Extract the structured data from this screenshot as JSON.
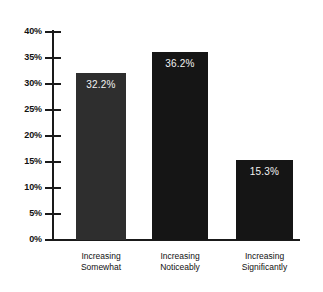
{
  "chart_data": {
    "type": "bar",
    "title": "",
    "subtitle": "",
    "xlabel": "",
    "ylabel": "",
    "categories": [
      "Increasing Somewhat",
      "Increasing Noticeably",
      "Increasing Significantly"
    ],
    "category_lines": [
      [
        "Increasing",
        "Somewhat"
      ],
      [
        "Increasing",
        "Noticeably"
      ],
      [
        "Increasing",
        "Significantly"
      ]
    ],
    "values": [
      32.2,
      36.2,
      15.3
    ],
    "value_labels": [
      "32.2%",
      "36.2%",
      "15.3%"
    ],
    "bar_colors": [
      "#2e2e2e",
      "#151515",
      "#151515"
    ],
    "ylim": [
      0,
      40
    ],
    "ytick_values": [
      0,
      5,
      10,
      15,
      20,
      25,
      30,
      35,
      40
    ],
    "ytick_labels": [
      "0%",
      "5%",
      "10%",
      "15%",
      "20%",
      "25%",
      "30%",
      "35%",
      "40%"
    ],
    "grid": false,
    "legend": "none",
    "axis_color": "#1a1a1a",
    "value_label_color": "#f2f2f2",
    "background_color": "#ffffff"
  }
}
